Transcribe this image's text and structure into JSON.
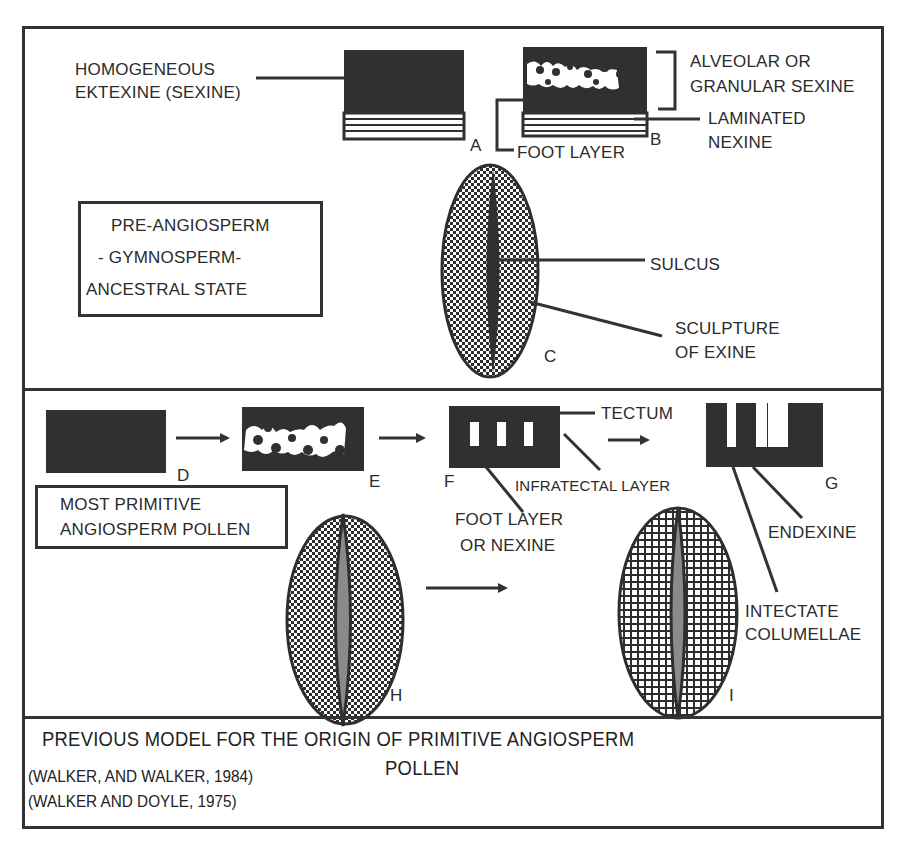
{
  "figure": {
    "title_line1": "PREVIOUS MODEL FOR THE ORIGIN OF PRIMITIVE ANGIOSPERM",
    "title_line2": "POLLEN",
    "citations": [
      "(WALKER, AND WALKER, 1984)",
      "(WALKER AND DOYLE, 1975)"
    ]
  },
  "panel_top": {
    "state_box": {
      "line1": "PRE-ANGIOSPERM",
      "line2": "-  GYMNOSPERM-",
      "line3": "ANCESTRAL  STATE"
    },
    "labels": {
      "homogeneous_line1": "HOMOGENEOUS",
      "homogeneous_line2": "EKTEXINE (SEXINE)",
      "alveolar_line1": "ALVEOLAR OR",
      "alveolar_line2": "GRANULAR  SEXINE",
      "laminated_line1": "LAMINATED",
      "laminated_line2": "NEXINE",
      "foot_layer": "FOOT LAYER",
      "sulcus": "SULCUS",
      "sculpture_line1": "SCULPTURE",
      "sculpture_line2": "OF  EXINE"
    },
    "letters": {
      "a": "A",
      "b": "B",
      "c": "C"
    }
  },
  "panel_bottom": {
    "state_box": {
      "line1": "MOST   PRIMITIVE",
      "line2": "ANGIOSPERM  POLLEN"
    },
    "labels": {
      "tectum": "TECTUM",
      "infratectal": "INFRATECTAL  LAYER",
      "foot_layer_line1": "FOOT  LAYER",
      "foot_layer_line2": "OR  NEXINE",
      "endexine": "ENDEXINE",
      "intectate_line1": "INTECTATE",
      "intectate_line2": "COLUMELLAE"
    },
    "letters": {
      "d": "D",
      "e": "E",
      "f": "F",
      "g": "G",
      "h": "H",
      "i": "I"
    }
  },
  "colors": {
    "ink": "#333333",
    "fill_dark": "#303030",
    "sulcus_grey": "#8a8a8a",
    "background": "#ffffff"
  }
}
